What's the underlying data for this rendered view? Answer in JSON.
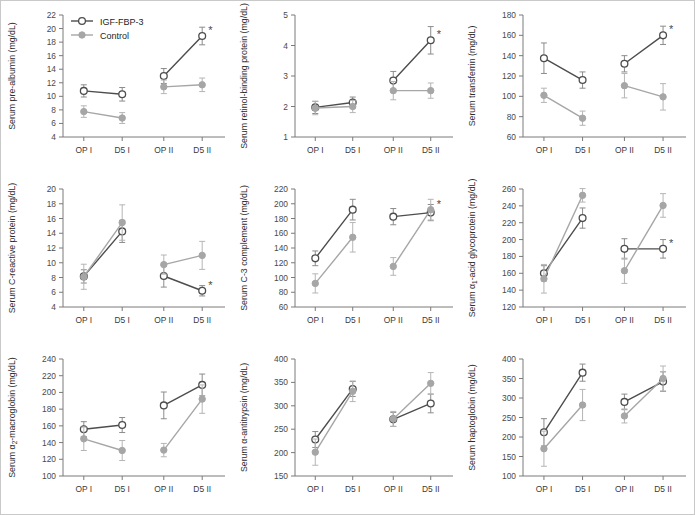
{
  "figure": {
    "panel_count": 9,
    "background_color": "#ffffff",
    "frame_color": "#c9c9c9"
  },
  "legend": {
    "position": "top-left of first panel",
    "entries": [
      {
        "label": "IGF-FBP-3",
        "marker": "open-circle",
        "color": "#4d4d4d",
        "fill": "#ffffff"
      },
      {
        "label": "Control",
        "marker": "filled-circle",
        "color": "#a6a6a6",
        "fill": "#a6a6a6"
      }
    ]
  },
  "annotations": {
    "significance_symbol": "*",
    "significance_note": "asterisk marks significant difference at that timepoint"
  },
  "chart_data": [
    {
      "id": "pre-albumin",
      "type": "line",
      "title": "",
      "ylabel": "Serum pre-albumin (mg/dL)",
      "xlabel": "",
      "categories": [
        "OP I",
        "D5 I",
        "OP II",
        "D5 II"
      ],
      "ylim": [
        4,
        22
      ],
      "yticks": [
        4,
        6,
        8,
        10,
        12,
        14,
        16,
        18,
        20,
        22
      ],
      "grid": false,
      "series": [
        {
          "name": "IGF-FBP-3",
          "values": [
            10.8,
            10.3,
            13.0,
            18.9
          ],
          "errors": [
            0.9,
            1.0,
            1.1,
            1.3
          ],
          "color": "#4d4d4d",
          "marker": "open-circle"
        },
        {
          "name": "Control",
          "values": [
            7.75,
            6.8,
            11.4,
            11.7
          ],
          "errors": [
            0.85,
            0.8,
            1.0,
            1.0
          ],
          "color": "#a6a6a6",
          "marker": "filled-circle"
        }
      ],
      "significance": [
        {
          "category": "D5 II",
          "series": "IGF-FBP-3",
          "symbol": "*"
        }
      ]
    },
    {
      "id": "retinol-binding-protein",
      "type": "line",
      "title": "",
      "ylabel": "Serum retinol-binding protein (mg/dL)",
      "xlabel": "",
      "categories": [
        "OP I",
        "D5 I",
        "OP II",
        "D5 II"
      ],
      "ylim": [
        1,
        5
      ],
      "yticks": [
        1,
        2,
        3,
        4,
        5
      ],
      "grid": false,
      "series": [
        {
          "name": "IGF-FBP-3",
          "values": [
            1.97,
            2.13,
            2.85,
            4.17
          ],
          "errors": [
            0.2,
            0.18,
            0.3,
            0.45
          ],
          "color": "#4d4d4d",
          "marker": "open-circle"
        },
        {
          "name": "Control",
          "values": [
            1.95,
            2.0,
            2.52,
            2.52
          ],
          "errors": [
            0.22,
            0.2,
            0.3,
            0.25
          ],
          "color": "#a6a6a6",
          "marker": "filled-circle"
        }
      ],
      "significance": [
        {
          "category": "D5 II",
          "series": "IGF-FBP-3",
          "symbol": "*"
        }
      ]
    },
    {
      "id": "transferrin",
      "type": "line",
      "title": "",
      "ylabel": "Serum transferrin (mg/dL)",
      "xlabel": "",
      "categories": [
        "OP I",
        "D5 I",
        "OP II",
        "D5 II"
      ],
      "ylim": [
        60,
        180
      ],
      "yticks": [
        60,
        80,
        100,
        120,
        140,
        160,
        180
      ],
      "grid": false,
      "series": [
        {
          "name": "IGF-FBP-3",
          "values": [
            137.5,
            116,
            132,
            160
          ],
          "errors": [
            15,
            8,
            8,
            9
          ],
          "color": "#4d4d4d",
          "marker": "open-circle"
        },
        {
          "name": "Control",
          "values": [
            101,
            78.5,
            110.5,
            99.5
          ],
          "errors": [
            7,
            7,
            12,
            13
          ],
          "color": "#a6a6a6",
          "marker": "filled-circle"
        }
      ],
      "significance": [
        {
          "category": "D5 II",
          "series": "IGF-FBP-3",
          "symbol": "*"
        }
      ]
    },
    {
      "id": "c-reactive-protein",
      "type": "line",
      "title": "",
      "ylabel": "Serum C-reactive protein (mg/dL)",
      "xlabel": "",
      "categories": [
        "OP I",
        "D5 I",
        "OP II",
        "D5 II"
      ],
      "ylim": [
        4,
        20
      ],
      "yticks": [
        4,
        6,
        8,
        10,
        12,
        14,
        16,
        18,
        20
      ],
      "grid": false,
      "series": [
        {
          "name": "IGF-FBP-3",
          "values": [
            8.15,
            14.25,
            8.2,
            6.2
          ],
          "errors": [
            0.9,
            1.5,
            1.5,
            0.7
          ],
          "color": "#4d4d4d",
          "marker": "open-circle"
        },
        {
          "name": "Control",
          "values": [
            8.1,
            15.45,
            9.75,
            11.0
          ],
          "errors": [
            1.7,
            2.4,
            1.3,
            1.9
          ],
          "color": "#a6a6a6",
          "marker": "filled-circle"
        }
      ],
      "significance": [
        {
          "category": "D5 II",
          "series": "IGF-FBP-3",
          "symbol": "*"
        }
      ]
    },
    {
      "id": "c3-complement",
      "type": "line",
      "title": "",
      "ylabel": "Serum C-3 complement (mg/dL)",
      "xlabel": "",
      "categories": [
        "OP I",
        "D5 I",
        "OP II",
        "D5 II"
      ],
      "ylim": [
        60,
        220
      ],
      "yticks": [
        60,
        80,
        100,
        120,
        140,
        160,
        180,
        200,
        220
      ],
      "grid": false,
      "series": [
        {
          "name": "IGF-FBP-3",
          "values": [
            126,
            192,
            182.5,
            188
          ],
          "errors": [
            10,
            14,
            11,
            11
          ],
          "color": "#4d4d4d",
          "marker": "open-circle"
        },
        {
          "name": "Control",
          "values": [
            92,
            154.5,
            115,
            192
          ],
          "errors": [
            13,
            20,
            12,
            14
          ],
          "color": "#a6a6a6",
          "marker": "filled-circle"
        }
      ],
      "significance": [
        {
          "category": "D5 II",
          "series": "Control",
          "symbol": "*"
        }
      ]
    },
    {
      "id": "alpha1-acid-glycoprotein",
      "type": "line",
      "title": "",
      "ylabel": "Serum α₁-acid glycoprotein (mg/dL)",
      "xlabel": "",
      "categories": [
        "OP I",
        "D5 I",
        "OP II",
        "D5 II"
      ],
      "ylim": [
        120,
        260
      ],
      "yticks": [
        120,
        140,
        160,
        180,
        200,
        220,
        240,
        260
      ],
      "grid": false,
      "series": [
        {
          "name": "IGF-FBP-3",
          "values": [
            160,
            225.5,
            189,
            189
          ],
          "errors": [
            9,
            12,
            12,
            11
          ],
          "color": "#4d4d4d",
          "marker": "open-circle"
        },
        {
          "name": "Control",
          "values": [
            153.5,
            252.5,
            163,
            240.5
          ],
          "errors": [
            17,
            8,
            15,
            14
          ],
          "color": "#a6a6a6",
          "marker": "filled-circle"
        }
      ],
      "significance": [
        {
          "category": "D5 II",
          "series": "IGF-FBP-3",
          "symbol": "*"
        }
      ]
    },
    {
      "id": "alpha2-macroglobin",
      "type": "line",
      "title": "",
      "ylabel": "Serum α₂-macroglobin (mg/dL)",
      "xlabel": "",
      "categories": [
        "OP I",
        "D5 I",
        "OP II",
        "D5 II"
      ],
      "ylim": [
        100,
        240
      ],
      "yticks": [
        100,
        120,
        140,
        160,
        180,
        200,
        220,
        240
      ],
      "grid": false,
      "series": [
        {
          "name": "IGF-FBP-3",
          "values": [
            156,
            161,
            184.5,
            209
          ],
          "errors": [
            9,
            9,
            16,
            13
          ],
          "color": "#4d4d4d",
          "marker": "open-circle"
        },
        {
          "name": "Control",
          "values": [
            144.5,
            130.5,
            131,
            192
          ],
          "errors": [
            14,
            12,
            8,
            17
          ],
          "color": "#a6a6a6",
          "marker": "filled-circle"
        }
      ],
      "significance": []
    },
    {
      "id": "alpha-antitrypsin",
      "type": "line",
      "title": "",
      "ylabel": "Serum α-antitrypsin (mg/dL)",
      "xlabel": "",
      "categories": [
        "OP I",
        "D5 I",
        "OP II",
        "D5 II"
      ],
      "ylim": [
        150,
        400
      ],
      "yticks": [
        150,
        200,
        250,
        300,
        350,
        400
      ],
      "grid": false,
      "series": [
        {
          "name": "IGF-FBP-3",
          "values": [
            228,
            336,
            271,
            305
          ],
          "errors": [
            17,
            16,
            15,
            20
          ],
          "color": "#4d4d4d",
          "marker": "open-circle"
        },
        {
          "name": "Control",
          "values": [
            201,
            331,
            272,
            348
          ],
          "errors": [
            28,
            22,
            16,
            23
          ],
          "color": "#a6a6a6",
          "marker": "filled-circle"
        }
      ],
      "significance": []
    },
    {
      "id": "haptoglobin",
      "type": "line",
      "title": "",
      "ylabel": "Serum haptoglobin (mg/dL)",
      "xlabel": "",
      "categories": [
        "OP I",
        "D5 I",
        "OP II",
        "D5 II"
      ],
      "ylim": [
        100,
        400
      ],
      "yticks": [
        100,
        150,
        200,
        250,
        300,
        350,
        400
      ],
      "grid": false,
      "series": [
        {
          "name": "IGF-FBP-3",
          "values": [
            212,
            365,
            290,
            342
          ],
          "errors": [
            35,
            22,
            20,
            25
          ],
          "color": "#4d4d4d",
          "marker": "open-circle"
        },
        {
          "name": "Control",
          "values": [
            170,
            282,
            254,
            350
          ],
          "errors": [
            45,
            40,
            18,
            32
          ],
          "color": "#a6a6a6",
          "marker": "filled-circle"
        }
      ],
      "significance": []
    }
  ]
}
